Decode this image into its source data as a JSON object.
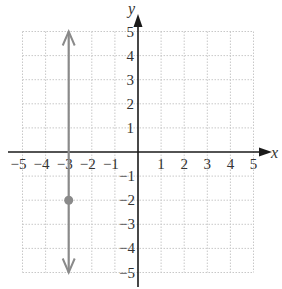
{
  "chart_data": {
    "type": "line",
    "title": "",
    "xlabel": "x",
    "ylabel": "y",
    "xlim": [
      -5,
      5
    ],
    "ylim": [
      -5,
      5
    ],
    "grid": true,
    "x_ticks": [
      "-5",
      "-4",
      "-3",
      "-2",
      "-1",
      "1",
      "2",
      "3",
      "4",
      "5"
    ],
    "y_ticks": [
      "5",
      "4",
      "3",
      "2",
      "1",
      "-1",
      "-2",
      "-3",
      "-4",
      "-5"
    ],
    "series": [
      {
        "name": "vertical line x = -3",
        "kind": "vertical_line",
        "x": -3,
        "y_range": [
          -5,
          5
        ],
        "arrows": "both",
        "color": "#8a8a8a"
      }
    ],
    "points": [
      {
        "x": -3,
        "y": -2,
        "color": "#8a8a8a"
      }
    ]
  },
  "labels": {
    "x_axis": "x",
    "y_axis": "y",
    "x_tick_labels": [
      "−5",
      "−4",
      "−3",
      "−2",
      "−1",
      "1",
      "2",
      "3",
      "4",
      "5"
    ],
    "y_tick_labels_pos": [
      "5",
      "4",
      "3",
      "2",
      "1"
    ],
    "y_tick_labels_neg": [
      "−1",
      "−2",
      "−3",
      "−4",
      "−5"
    ]
  },
  "colors": {
    "axis": "#1a1a1a",
    "grid": "#c8c8c8",
    "line": "#8a8a8a",
    "point": "#8a8a8a"
  }
}
